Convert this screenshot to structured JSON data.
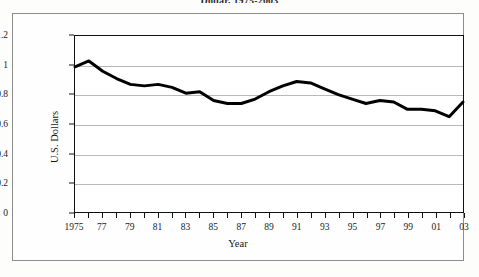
{
  "caption": {
    "text": "Dollar, 1975-2003"
  },
  "chart_data": {
    "type": "line",
    "title": "Dollar, 1975-2003",
    "xlabel": "Year",
    "ylabel": "U.S. Dollars",
    "ylim": [
      0,
      1.2
    ],
    "xlim": [
      1975,
      2003
    ],
    "yticks": [
      "0",
      "0.2",
      "0.4",
      "0.6",
      "0.8",
      "1",
      "1.2"
    ],
    "ytick_values": [
      0,
      0.2,
      0.4,
      0.6,
      0.8,
      1,
      1.2
    ],
    "xticks": [
      "1975",
      "77",
      "79",
      "81",
      "83",
      "85",
      "87",
      "89",
      "91",
      "93",
      "95",
      "97",
      "99",
      "01",
      "03"
    ],
    "xtick_values": [
      1975,
      1977,
      1979,
      1981,
      1983,
      1985,
      1987,
      1989,
      1991,
      1993,
      1995,
      1997,
      1999,
      2001,
      2003
    ],
    "grid": "horizontal",
    "legend": "none",
    "line_color": "#000000",
    "line_width": 3,
    "x": [
      1975,
      1976,
      1977,
      1978,
      1979,
      1980,
      1981,
      1982,
      1983,
      1984,
      1985,
      1986,
      1987,
      1988,
      1989,
      1990,
      1991,
      1992,
      1993,
      1994,
      1995,
      1996,
      1997,
      1998,
      1999,
      2000,
      2001,
      2002,
      2003
    ],
    "values": [
      0.99,
      1.03,
      0.96,
      0.91,
      0.87,
      0.86,
      0.87,
      0.85,
      0.81,
      0.82,
      0.76,
      0.74,
      0.74,
      0.77,
      0.82,
      0.86,
      0.89,
      0.88,
      0.84,
      0.8,
      0.77,
      0.74,
      0.76,
      0.75,
      0.7,
      0.7,
      0.69,
      0.65,
      0.75
    ]
  }
}
